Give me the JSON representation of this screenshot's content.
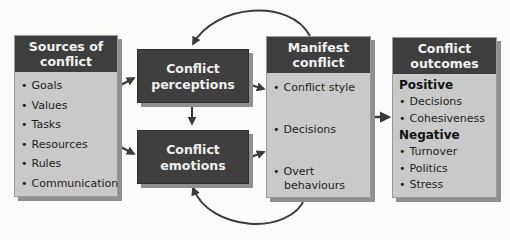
{
  "diagram": {
    "sources": {
      "title_line1": "Sources of",
      "title_line2": "conflict",
      "items": [
        "Goals",
        "Values",
        "Tasks",
        "Resources",
        "Rules",
        "Communication"
      ]
    },
    "perceptions": {
      "line1": "Conflict",
      "line2": "perceptions"
    },
    "emotions": {
      "line1": "Conflict",
      "line2": "emotions"
    },
    "manifest": {
      "title_line1": "Manifest",
      "title_line2": "conflict",
      "items": [
        "Conflict style",
        "Decisions",
        "Overt behaviours"
      ]
    },
    "outcomes": {
      "title_line1": "Conflict",
      "title_line2": "outcomes",
      "positive_label": "Positive",
      "positive_items": [
        "Decisions",
        "Cohesiveness"
      ],
      "negative_label": "Negative",
      "negative_items": [
        "Turnover",
        "Politics",
        "Stress"
      ]
    },
    "colors": {
      "dark_box": "#3f3f3f",
      "light_box": "#c9c9c9",
      "arrow": "#3a3a3a",
      "shadow": "#8f8f8f"
    }
  }
}
